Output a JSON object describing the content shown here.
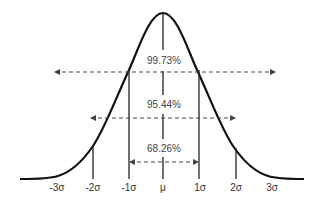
{
  "diagram": {
    "title": "",
    "type": "normal-distribution",
    "axis_labels": [
      "-3σ",
      "-2σ",
      "-1σ",
      "μ",
      "1σ",
      "2σ",
      "3σ"
    ],
    "ranges": [
      {
        "label": "99.73%",
        "span": "±3σ"
      },
      {
        "label": "95.44%",
        "span": "±2σ"
      },
      {
        "label": "68.26%",
        "span": "±1σ"
      }
    ],
    "colors": {
      "curve": "#111111",
      "lines": "#222222",
      "arrows": "#444444",
      "text": "#333333"
    }
  }
}
